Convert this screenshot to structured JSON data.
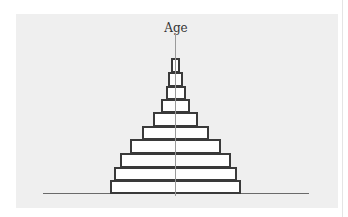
{
  "diagram": {
    "axis_label": "Age",
    "type": "population-pyramid",
    "bars": [
      {
        "left": 110,
        "right": 241,
        "top": 180,
        "bottom": 194
      },
      {
        "left": 114,
        "right": 237,
        "top": 167,
        "bottom": 181
      },
      {
        "left": 120,
        "right": 231,
        "top": 153,
        "bottom": 168
      },
      {
        "left": 130,
        "right": 221,
        "top": 139,
        "bottom": 154
      },
      {
        "left": 142,
        "right": 209,
        "top": 126,
        "bottom": 140
      },
      {
        "left": 153,
        "right": 198,
        "top": 112,
        "bottom": 127
      },
      {
        "left": 161,
        "right": 190,
        "top": 99,
        "bottom": 113
      },
      {
        "left": 166,
        "right": 186,
        "top": 86,
        "bottom": 100
      },
      {
        "left": 168,
        "right": 183,
        "top": 72,
        "bottom": 87
      },
      {
        "left": 171,
        "right": 180,
        "top": 58,
        "bottom": 73
      }
    ]
  }
}
